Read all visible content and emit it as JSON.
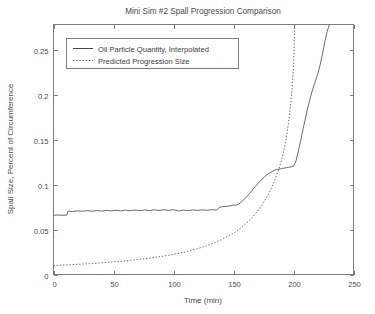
{
  "chart_data": {
    "type": "line",
    "title": "Mini Sim #2 Spall Progression Comparison",
    "xlabel": "Time (min)",
    "ylabel": "Spall Size, Percent of Circumference",
    "xlim": [
      0,
      250
    ],
    "ylim": [
      0,
      0.278
    ],
    "xticks": [
      0,
      50,
      100,
      150,
      200,
      250
    ],
    "xticklabels": [
      "0",
      "50",
      "100",
      "150",
      "200",
      "250"
    ],
    "yticks": [
      0,
      0.05,
      0.1,
      0.15,
      0.2,
      0.25
    ],
    "yticklabels": [
      "0",
      "0.05",
      "0.1",
      "0.15",
      "0.2",
      "0.25"
    ],
    "grid": false,
    "legend_position": "upper left",
    "series": [
      {
        "name": "Oil Particle Quantity, Interpolated",
        "style": "solid",
        "x": [
          0,
          4,
          8,
          11,
          12,
          13,
          16,
          20,
          24,
          28,
          32,
          36,
          40,
          44,
          48,
          52,
          56,
          60,
          64,
          68,
          72,
          76,
          80,
          84,
          88,
          92,
          96,
          100,
          104,
          108,
          112,
          116,
          120,
          124,
          128,
          132,
          136,
          138,
          140,
          142,
          146,
          150,
          152,
          154,
          156,
          160,
          164,
          168,
          172,
          176,
          180,
          184,
          186,
          188,
          190,
          192,
          194,
          196,
          198,
          200,
          202,
          204,
          206,
          208,
          210,
          212,
          214,
          216,
          218,
          220,
          222,
          224,
          226,
          228,
          230
        ],
        "y": [
          0.066,
          0.0661,
          0.0659,
          0.066,
          0.0702,
          0.0705,
          0.07,
          0.0708,
          0.0703,
          0.071,
          0.0704,
          0.0712,
          0.0706,
          0.0713,
          0.0707,
          0.0714,
          0.0708,
          0.0716,
          0.0709,
          0.0717,
          0.071,
          0.0718,
          0.0711,
          0.0719,
          0.0712,
          0.072,
          0.0713,
          0.0721,
          0.0707,
          0.0716,
          0.071,
          0.0718,
          0.0712,
          0.0719,
          0.0714,
          0.0721,
          0.0716,
          0.0745,
          0.0752,
          0.0756,
          0.076,
          0.0772,
          0.077,
          0.078,
          0.08,
          0.085,
          0.091,
          0.0975,
          0.1035,
          0.109,
          0.113,
          0.1158,
          0.1168,
          0.1172,
          0.1178,
          0.1182,
          0.1188,
          0.1192,
          0.1198,
          0.1205,
          0.126,
          0.137,
          0.149,
          0.162,
          0.174,
          0.186,
          0.1965,
          0.206,
          0.214,
          0.2225,
          0.232,
          0.244,
          0.258,
          0.27,
          0.278
        ]
      },
      {
        "name": "Predicted Progression Size",
        "style": "dotted",
        "x": [
          0,
          10,
          20,
          30,
          40,
          50,
          60,
          70,
          80,
          90,
          100,
          110,
          120,
          130,
          140,
          150,
          155,
          160,
          165,
          170,
          175,
          180,
          184,
          188,
          190,
          192,
          194,
          196,
          198,
          200,
          201
        ],
        "y": [
          0.01,
          0.0106,
          0.0113,
          0.0121,
          0.013,
          0.014,
          0.0152,
          0.0166,
          0.0182,
          0.0201,
          0.0224,
          0.0252,
          0.0287,
          0.033,
          0.0386,
          0.046,
          0.0506,
          0.056,
          0.0624,
          0.0702,
          0.0798,
          0.0916,
          0.1035,
          0.118,
          0.127,
          0.138,
          0.152,
          0.17,
          0.194,
          0.23,
          0.278
        ]
      }
    ]
  },
  "legend": {
    "entries": [
      {
        "label": "Oil Particle Quantity, Interpolated",
        "style": "solid"
      },
      {
        "label": "Predicted Progression Size",
        "style": "dotted"
      }
    ]
  }
}
